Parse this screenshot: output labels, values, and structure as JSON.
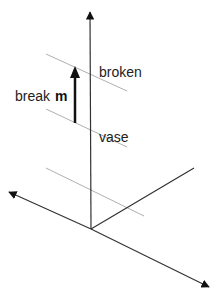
{
  "diagram": {
    "labels": {
      "broken": "broken",
      "vase": "vase",
      "break": "break",
      "vector": "m"
    },
    "colors": {
      "axis": "#333333",
      "plane_line": "#b0b0b0",
      "vector": "#111111"
    },
    "axes": [
      {
        "name": "vertical-axis",
        "from": [
          91,
          229
        ],
        "to": [
          90,
          11
        ],
        "arrow": true
      },
      {
        "name": "left-axis",
        "from": [
          91,
          229
        ],
        "to": [
          8,
          192
        ],
        "arrow": true
      },
      {
        "name": "right-down-axis",
        "from": [
          91,
          229
        ],
        "to": [
          210,
          287
        ],
        "arrow": true
      },
      {
        "name": "right-up-axis",
        "from": [
          91,
          229
        ],
        "to": [
          194,
          168
        ],
        "arrow": false
      }
    ],
    "plane_lines": [
      {
        "name": "broken-line",
        "from": [
          46,
          54
        ],
        "to": [
          127,
          91
        ]
      },
      {
        "name": "vase-line",
        "from": [
          46,
          109
        ],
        "to": [
          127,
          147
        ]
      },
      {
        "name": "origin-line",
        "from": [
          46,
          168
        ],
        "to": [
          144,
          216
        ]
      }
    ],
    "vector": {
      "from": [
        75,
        123
      ],
      "to": [
        75,
        67
      ]
    }
  }
}
